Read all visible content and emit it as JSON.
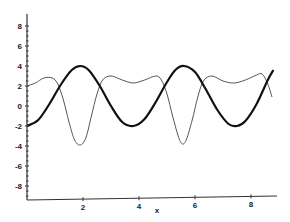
{
  "chart_data": {
    "type": "line",
    "title": "",
    "xlabel": "x",
    "ylabel": "",
    "xlim": [
      0,
      8.8
    ],
    "ylim": [
      -9.4,
      9.2
    ],
    "x_ticks": [
      2,
      4,
      6,
      8
    ],
    "y_ticks": [
      -8,
      -6,
      -4,
      -2,
      0,
      2,
      4,
      6,
      8
    ],
    "grid": false,
    "legend": "none",
    "series": [
      {
        "name": "thick curve",
        "style": "thick",
        "color": "#111111",
        "x": [
          0,
          0.4,
          0.8,
          1.2,
          1.6,
          1.9,
          2.2,
          2.6,
          3.0,
          3.4,
          3.8,
          4.2,
          4.6,
          5.0,
          5.3,
          5.6,
          6.0,
          6.4,
          6.8,
          7.2,
          7.5,
          7.8,
          8.2,
          8.6,
          8.8
        ],
        "y": [
          -2.0,
          -1.4,
          0.2,
          2.1,
          3.6,
          4.0,
          3.6,
          2.0,
          0.0,
          -1.6,
          -2.0,
          -1.3,
          0.4,
          2.4,
          3.6,
          4.0,
          3.4,
          1.6,
          -0.4,
          -1.8,
          -2.0,
          -1.5,
          0.2,
          2.6,
          3.6
        ]
      },
      {
        "name": "thin curve",
        "style": "thin",
        "color": "#555555",
        "x": [
          0,
          0.3,
          0.6,
          0.9,
          1.1,
          1.3,
          1.5,
          1.7,
          1.9,
          2.1,
          2.3,
          2.5,
          2.7,
          3.0,
          3.4,
          3.8,
          4.2,
          4.6,
          4.8,
          5.0,
          5.2,
          5.4,
          5.55,
          5.7,
          5.9,
          6.1,
          6.3,
          6.6,
          7.0,
          7.4,
          7.8,
          8.2,
          8.4,
          8.6,
          8.75
        ],
        "y": [
          2.0,
          2.3,
          2.8,
          2.8,
          2.2,
          0.6,
          -1.6,
          -3.4,
          -3.9,
          -3.2,
          -1.0,
          1.2,
          2.6,
          3.0,
          2.6,
          2.3,
          2.6,
          3.0,
          2.6,
          1.2,
          -1.0,
          -3.0,
          -3.8,
          -3.3,
          -1.4,
          0.9,
          2.5,
          3.0,
          2.5,
          2.3,
          2.6,
          3.1,
          3.2,
          2.2,
          0.9
        ]
      }
    ]
  },
  "axes": {
    "x_label": "x",
    "y_tick_labels": [
      "8",
      "6",
      "4",
      "2",
      "0",
      "-2",
      "-4",
      "-6",
      "-8"
    ],
    "x_tick_labels": [
      "2",
      "4",
      "6",
      "8"
    ]
  }
}
